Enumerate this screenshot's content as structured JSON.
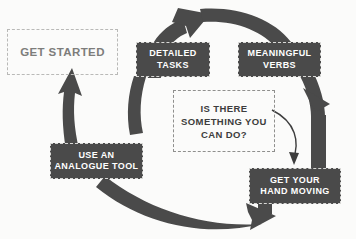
{
  "diagram": {
    "type": "cycle-flow",
    "title_faint": "",
    "background_color": "#fbfbfa",
    "accent_color": "#4a4a4a",
    "nodes": [
      {
        "id": "get-started",
        "style": "ghost",
        "lines": [
          "GET STARTED"
        ],
        "label": "GET STARTED"
      },
      {
        "id": "detailed-tasks",
        "style": "solid",
        "lines": [
          "DETAILED",
          "TASKS"
        ],
        "label": "DETAILED TASKS"
      },
      {
        "id": "meaningful-verbs",
        "style": "solid",
        "lines": [
          "MEANINGFUL",
          "VERBS"
        ],
        "label": "MEANINGFUL VERBS"
      },
      {
        "id": "hand-moving",
        "style": "solid",
        "lines": [
          "GET YOUR",
          "HAND MOVING"
        ],
        "label": "GET YOUR HAND MOVING"
      },
      {
        "id": "analogue-tool",
        "style": "solid",
        "lines": [
          "USE AN",
          "ANALOGUE TOOL"
        ],
        "label": "USE AN ANALOGUE TOOL"
      },
      {
        "id": "question",
        "style": "question",
        "lines": [
          "IS THERE",
          "SOMETHING YOU",
          "CAN DO?"
        ],
        "label": "IS THERE SOMETHING YOU CAN DO?"
      }
    ],
    "arrows": [
      {
        "id": "arrow-get-started-to-detailed",
        "from": "get-started",
        "to": "detailed-tasks",
        "shape": "arc-top-left"
      },
      {
        "id": "arrow-detailed-to-meaningful",
        "from": "detailed-tasks",
        "to": "meaningful-verbs",
        "shape": "arc-top"
      },
      {
        "id": "arrow-meaningful-to-hand-moving",
        "from": "meaningful-verbs",
        "to": "hand-moving",
        "shape": "arc-right"
      },
      {
        "id": "arrow-hand-moving-to-analogue",
        "from": "hand-moving",
        "to": "analogue-tool",
        "shape": "arc-bottom"
      },
      {
        "id": "arrow-analogue-to-get-started",
        "from": "analogue-tool",
        "to": "get-started",
        "shape": "arrow-left-up"
      },
      {
        "id": "arrow-question-to-hand-moving",
        "from": "question",
        "to": "hand-moving",
        "shape": "thin-curve"
      }
    ]
  }
}
